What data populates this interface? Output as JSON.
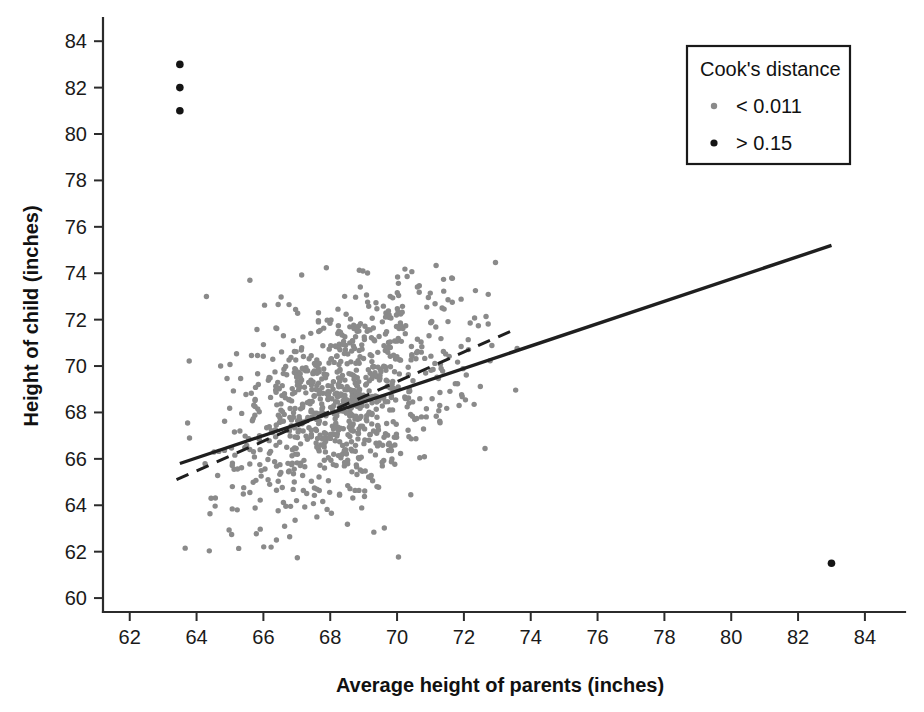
{
  "chart_data": {
    "type": "scatter",
    "title": "",
    "xlabel": "Average height of parents (inches)",
    "ylabel": "Height of child (inches)",
    "xlim": [
      61.2,
      85.2
    ],
    "ylim": [
      59.4,
      85.0
    ],
    "xticks": [
      62,
      64,
      66,
      68,
      70,
      72,
      74,
      76,
      78,
      80,
      82,
      84
    ],
    "yticks": [
      60,
      62,
      64,
      66,
      68,
      70,
      72,
      74,
      76,
      78,
      80,
      82,
      84
    ],
    "grid": false,
    "legend": {
      "position": "top-right",
      "title": "Cook's distance",
      "entries": [
        {
          "label": "< 0.011",
          "marker": "small-gray-dot",
          "color": "#8a8a8a"
        },
        {
          "label": "> 0.15",
          "marker": "black-dot",
          "color": "#141414"
        }
      ]
    },
    "colors": {
      "low_influence_points": "#8a8a8a",
      "high_influence_points": "#141414",
      "fit_line": "#1f1f1f",
      "axis": "#2b2b2b"
    },
    "series": [
      {
        "name": "< 0.011",
        "marker": "open-gray-circle",
        "color": "#8a8a8a",
        "note": "Main cloud of parent/child height observations; dense core near (68.4, 68.6), parent heights roughly 63.5-73.5 inches, child heights roughly 61.8-74.4 inches.",
        "cluster": {
          "x_mean": 68.4,
          "y_mean": 68.6,
          "x_sd": 1.75,
          "y_sd": 2.45,
          "correlation": 0.46,
          "n": 920,
          "x_range": [
            63.4,
            73.6
          ],
          "y_range": [
            61.6,
            74.5
          ]
        }
      },
      {
        "name": "> 0.15",
        "marker": "filled-black-circle",
        "color": "#141414",
        "points": [
          {
            "x": 63.5,
            "y": 83.0
          },
          {
            "x": 63.5,
            "y": 82.0
          },
          {
            "x": 63.5,
            "y": 81.0
          },
          {
            "x": 83.0,
            "y": 61.5
          }
        ]
      }
    ],
    "lines": [
      {
        "name": "ordinary least squares fit (all data)",
        "style": "solid",
        "color": "#1f1f1f",
        "x_start": 63.5,
        "y_start": 65.8,
        "x_end": 83.0,
        "y_end": 75.2,
        "slope": 0.482,
        "intercept": 35.2
      },
      {
        "name": "robust fit excluding influential points",
        "style": "dashed",
        "color": "#1f1f1f",
        "x_start": 63.4,
        "y_start": 65.1,
        "x_end": 73.4,
        "y_end": 71.5,
        "slope": 0.64,
        "intercept": 24.5
      }
    ]
  },
  "axes": {
    "x": {
      "label": "Average height of parents (inches)",
      "ticks": [
        "62",
        "64",
        "66",
        "68",
        "70",
        "72",
        "74",
        "76",
        "78",
        "80",
        "82",
        "84"
      ]
    },
    "y": {
      "label": "Height of child (inches)",
      "ticks": [
        "60",
        "62",
        "64",
        "66",
        "68",
        "70",
        "72",
        "74",
        "76",
        "78",
        "80",
        "82",
        "84"
      ]
    }
  },
  "legend": {
    "title": "Cook's distance",
    "items": [
      {
        "label": "< 0.011"
      },
      {
        "label": "> 0.15"
      }
    ]
  }
}
